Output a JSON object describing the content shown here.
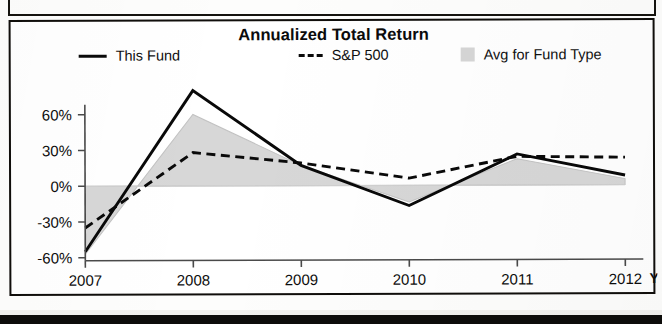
{
  "figure": {
    "title": "Annualized Total Return",
    "x_axis_suffix": "Y"
  },
  "legend": {
    "items": [
      {
        "label": "This Fund",
        "marker": "solid-line-swatch",
        "color": "#0a0a0a"
      },
      {
        "label": "S&P 500",
        "marker": "dashed-line-swatch",
        "color": "#0a0a0a"
      },
      {
        "label": "Avg for Fund Type",
        "marker": "gray-area-swatch",
        "color": "#d6d6d6"
      }
    ]
  },
  "chart_data": {
    "type": "line",
    "title": "Annualized Total Return",
    "xlabel": "",
    "ylabel": "",
    "categories": [
      "2007",
      "2008",
      "2009",
      "2010",
      "2011",
      "2012"
    ],
    "x_tick_labels": [
      "2007",
      "2008",
      "2009",
      "2010",
      "2011",
      "2012"
    ],
    "y_tick_labels": [
      "60%",
      "30%",
      "0%",
      "-30%",
      "-60%"
    ],
    "y_ticks": [
      60,
      30,
      0,
      -30,
      -60
    ],
    "ylim": [
      -60,
      90
    ],
    "grid": false,
    "legend_position": "top",
    "series": [
      {
        "name": "This Fund",
        "style": "solid",
        "color": "#0a0a0a",
        "values": [
          -55,
          80,
          17,
          -17,
          26,
          8
        ]
      },
      {
        "name": "S&P 500",
        "style": "dashed",
        "color": "#0a0a0a",
        "values": [
          -35,
          28,
          19,
          6,
          24,
          23
        ]
      },
      {
        "name": "Avg for Fund Type",
        "style": "filled-area",
        "color": "#d7d7d7",
        "values": [
          -57,
          60,
          17,
          -14,
          22,
          5
        ]
      }
    ]
  }
}
